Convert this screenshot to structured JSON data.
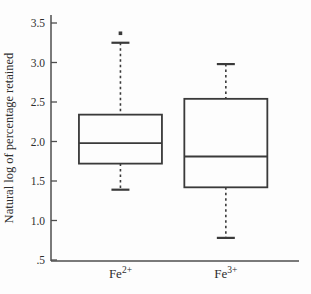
{
  "chart_data": {
    "type": "boxplot",
    "title": "",
    "xlabel": "",
    "ylabel": "Natural log of percentage retained",
    "ylim": [
      0.5,
      3.5
    ],
    "yticks": [
      3.5,
      3.0,
      2.5,
      2.0,
      1.5,
      1.0,
      0.5
    ],
    "ytick_labels": [
      "3.5",
      "3.0",
      "2.5",
      "2.0",
      "1.5",
      "1.0",
      ".5"
    ],
    "grid": false,
    "legend": "none",
    "categories": [
      {
        "base": "Fe",
        "sup": "2+"
      },
      {
        "base": "Fe",
        "sup": "3+"
      }
    ],
    "series": [
      {
        "name": "Fe2+",
        "whisker_low": 1.39,
        "q1": 1.72,
        "median": 1.98,
        "q3": 2.34,
        "whisker_high": 3.25,
        "outliers": [
          3.37
        ]
      },
      {
        "name": "Fe3+",
        "whisker_low": 0.78,
        "q1": 1.42,
        "median": 1.81,
        "q3": 2.54,
        "whisker_high": 2.98,
        "outliers": []
      }
    ],
    "colors": {
      "box_stroke": "#3a3a3a",
      "axis": "#4e4e4e",
      "text": "#2e2e2e",
      "background": "#fdfdfd",
      "box_fill": "#fdfdfd"
    }
  }
}
